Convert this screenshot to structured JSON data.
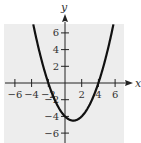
{
  "chart_data": {
    "type": "line",
    "title": "",
    "xlabel": "x",
    "ylabel": "y",
    "xlim": [
      -7,
      7
    ],
    "ylim": [
      -7,
      7
    ],
    "grid": false,
    "background": "#ededed",
    "x_ticks": [
      -6,
      -4,
      -2,
      2,
      4,
      6
    ],
    "y_ticks": [
      -6,
      -4,
      -2,
      2,
      4,
      6
    ],
    "x_tick_labels": [
      "−6",
      "−4",
      "−2",
      "2",
      "4",
      "6"
    ],
    "y_tick_labels": [
      "−6",
      "−4",
      "−2",
      "2",
      "4",
      "6"
    ],
    "series": [
      {
        "name": "parabola",
        "equation": "y = 0.5x^2 - x - 4",
        "color": "#111111",
        "x_intercepts": [
          -2,
          4
        ],
        "y_intercept": -4,
        "vertex": [
          1,
          -4.5
        ],
        "x": [
          -3.8,
          -3,
          -2,
          -1,
          0,
          1,
          2,
          3,
          4,
          5,
          5.8
        ],
        "y": [
          7.02,
          3.5,
          0,
          -2.5,
          -4,
          -4.5,
          -4,
          -2.5,
          0,
          3.5,
          7.02
        ]
      }
    ]
  }
}
